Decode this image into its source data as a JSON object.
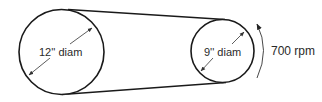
{
  "diagram": {
    "type": "belt-pulley-system",
    "colors": {
      "stroke": "#1a1a1a",
      "arrow": "#333333",
      "text": "#2a2a2a",
      "background": "#ffffff"
    },
    "large_pulley": {
      "label": "12'' diam",
      "cx": 61.5,
      "cy": 52,
      "r": 42.5
    },
    "small_pulley": {
      "label": "9'' diam",
      "cx": 222.5,
      "cy": 51,
      "r": 31.5
    },
    "belt": {
      "top": {
        "x1": 68,
        "y1": 9.5,
        "x2": 225,
        "y2": 19.5
      },
      "bottom": {
        "x1": 62,
        "y1": 94.5,
        "x2": 226,
        "y2": 82.5
      }
    },
    "rotation": {
      "label": "700 rpm",
      "direction": "counterclockwise"
    }
  }
}
